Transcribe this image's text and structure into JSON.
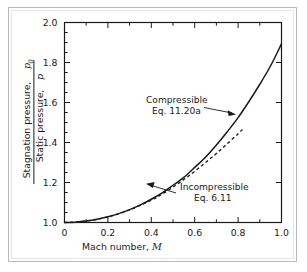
{
  "figure": {
    "background_color": "#ffffff",
    "frame_color": "#b9b9b9",
    "axis_color": "#1a1a1a",
    "curve_color": "#1a1a1a"
  },
  "axes": {
    "x_title_text": "Mach number,",
    "x_title_symbol": "M",
    "y_title_numerator": "Stagnation pressure,",
    "y_title_numerator_symbol": "p",
    "y_title_numerator_subscript": "0",
    "y_title_denominator": "Static pressure,",
    "y_title_denominator_symbol": "p",
    "x_tick_labels": [
      "0",
      "0.2",
      "0.4",
      "0.6",
      "0.8",
      "1.0"
    ],
    "y_tick_labels": [
      "1.0",
      "1.2",
      "1.4",
      "1.6",
      "1.8",
      "2.0"
    ]
  },
  "annotations": {
    "compressible": {
      "line1": "Compressible",
      "line2": "Eq. 11.20a"
    },
    "incompressible": {
      "line1": "Incompressible",
      "line2": "Eq. 6.11"
    }
  },
  "chart_data": {
    "type": "line",
    "title": "",
    "xlabel": "Mach number, M",
    "ylabel": "Stagnation pressure, p0 / Static pressure, p",
    "xlim": [
      0,
      1.0
    ],
    "ylim": [
      1.0,
      2.0
    ],
    "xticks": [
      0,
      0.2,
      0.4,
      0.6,
      0.8,
      1.0
    ],
    "yticks": [
      1.0,
      1.2,
      1.4,
      1.6,
      1.8,
      2.0
    ],
    "x_minor_tick_step": 0.1,
    "y_minor_tick_step": 0.05,
    "grid": false,
    "legend_position": "inline-annotations",
    "series": [
      {
        "name": "Compressible Eq. 11.20a",
        "style": "solid",
        "x": [
          0.0,
          0.05,
          0.1,
          0.15,
          0.2,
          0.25,
          0.3,
          0.35,
          0.4,
          0.45,
          0.5,
          0.55,
          0.6,
          0.65,
          0.7,
          0.75,
          0.8,
          0.85,
          0.9,
          0.95,
          1.0
        ],
        "values": [
          1.0,
          1.0018,
          1.007,
          1.0158,
          1.0283,
          1.0445,
          1.0644,
          1.0882,
          1.1161,
          1.1483,
          1.1862,
          1.2253,
          1.2755,
          1.3262,
          1.3871,
          1.4537,
          1.5243,
          1.6049,
          1.6913,
          1.7837,
          1.8929
        ]
      },
      {
        "name": "Incompressible Eq. 6.11",
        "style": "dashed",
        "x": [
          0.0,
          0.1,
          0.2,
          0.3,
          0.4,
          0.45,
          0.5,
          0.55,
          0.6,
          0.65,
          0.7,
          0.75,
          0.8,
          0.82
        ],
        "values": [
          1.0,
          1.007,
          1.028,
          1.063,
          1.112,
          1.142,
          1.177,
          1.215,
          1.256,
          1.3,
          1.345,
          1.394,
          1.444,
          1.465
        ]
      }
    ],
    "annotations": [
      {
        "text": "Compressible Eq. 11.20a",
        "points_to_x": 0.815,
        "points_to_y": 1.545
      },
      {
        "text": "Incompressible Eq. 6.11",
        "points_to_x": 0.495,
        "points_to_y": 1.178
      }
    ]
  }
}
